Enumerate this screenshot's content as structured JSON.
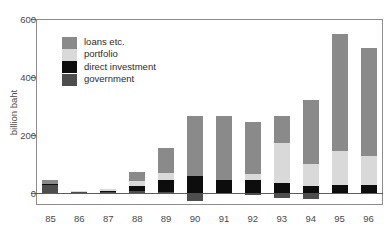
{
  "figure": {
    "top_caption": "",
    "background": "#ffffff"
  },
  "legend": {
    "position": "top-left-inside",
    "entries": [
      {
        "label": "loans etc.",
        "color": "#8a8a8a"
      },
      {
        "label": "portfolio",
        "color": "#d9d9d9"
      },
      {
        "label": "direct investment",
        "color": "#0d0d0d"
      },
      {
        "label": "government",
        "color": "#4d4d4d"
      }
    ]
  },
  "axes": {
    "ylabel": "billion baht",
    "yticks": [
      0,
      200,
      400,
      600
    ],
    "ytick_labels": [
      "0",
      "200",
      "400",
      "600"
    ],
    "ylim": [
      -40,
      600
    ],
    "xtick_labels": [
      "85",
      "86",
      "87",
      "88",
      "89",
      "90",
      "91",
      "92",
      "93",
      "94",
      "95",
      "96"
    ]
  },
  "chart_data": {
    "type": "bar",
    "subtype": "stacked-bar-with-negatives",
    "title": "",
    "xlabel": "",
    "ylabel": "billion baht",
    "ylim": [
      -40,
      600
    ],
    "yticks": [
      0,
      200,
      400,
      600
    ],
    "grid": false,
    "legend_position": "upper left (inside axes)",
    "categories": [
      "85",
      "86",
      "87",
      "88",
      "89",
      "90",
      "91",
      "92",
      "93",
      "94",
      "95",
      "96"
    ],
    "series": [
      {
        "name": "government",
        "color": "#4d4d4d",
        "values": [
          30,
          5,
          5,
          8,
          5,
          -25,
          0,
          -5,
          -15,
          -20,
          0,
          0
        ]
      },
      {
        "name": "direct investment",
        "color": "#0d0d0d",
        "values": [
          2,
          2,
          2,
          18,
          40,
          60,
          45,
          45,
          35,
          25,
          30,
          30
        ]
      },
      {
        "name": "portfolio",
        "color": "#d9d9d9",
        "values": [
          0,
          1,
          8,
          15,
          25,
          0,
          0,
          20,
          140,
          75,
          115,
          100
        ]
      },
      {
        "name": "loans etc.",
        "color": "#8a8a8a",
        "values": [
          15,
          0,
          0,
          34,
          85,
          205,
          220,
          180,
          90,
          220,
          405,
          370
        ]
      }
    ],
    "totals_positive": [
      47,
      8,
      15,
      75,
      155,
      265,
      265,
      245,
      265,
      320,
      550,
      500
    ],
    "totals_negative": [
      0,
      0,
      0,
      0,
      0,
      -25,
      0,
      -5,
      -15,
      -20,
      0,
      0
    ]
  }
}
